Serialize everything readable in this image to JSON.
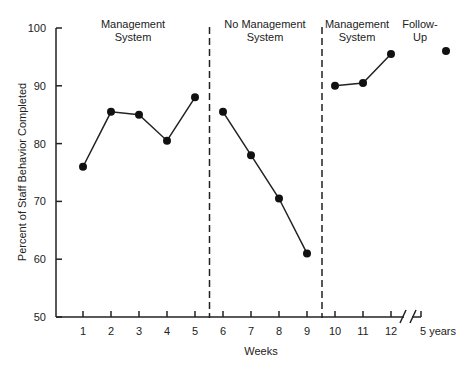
{
  "chart_data": {
    "type": "line",
    "title": "",
    "xlabel": "Weeks",
    "ylabel": "Percent of Staff Behavior Completed",
    "ylim": [
      50,
      100
    ],
    "yticks": [
      50,
      60,
      70,
      80,
      90,
      100
    ],
    "categories": [
      "1",
      "2",
      "3",
      "4",
      "5",
      "6",
      "7",
      "8",
      "9",
      "10",
      "11",
      "12",
      "5 years"
    ],
    "grid": false,
    "legend": "none",
    "phases": [
      {
        "label_line1": "Management",
        "label_line2": "System",
        "x": [
          "1",
          "2",
          "3",
          "4",
          "5"
        ],
        "values": [
          76,
          85.5,
          85,
          80.5,
          88
        ]
      },
      {
        "label_line1": "No Management",
        "label_line2": "System",
        "x": [
          "6",
          "7",
          "8",
          "9"
        ],
        "values": [
          85.5,
          78,
          70.5,
          61
        ]
      },
      {
        "label_line1": "Management",
        "label_line2": "System",
        "x": [
          "10",
          "11",
          "12"
        ],
        "values": [
          90,
          90.5,
          95.5
        ]
      },
      {
        "label_line1": "Follow-",
        "label_line2": "Up",
        "x": [
          "5 years"
        ],
        "values": [
          96
        ]
      }
    ],
    "annotations": [
      "phase-change dashed lines between weeks 5-6 and 9-10",
      "axis break between week 12 and 5 years"
    ]
  }
}
